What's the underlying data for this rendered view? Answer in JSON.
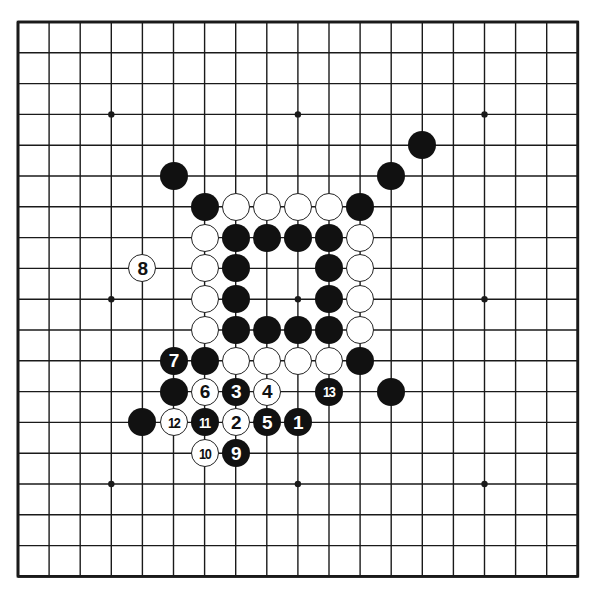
{
  "board": {
    "size": 19,
    "origin_x": 18,
    "origin_y": 22,
    "spacing_x": 31.1,
    "spacing_y": 30.8,
    "line_color": "#1a1a1a",
    "background": "#ffffff",
    "star_points": [
      [
        3,
        3
      ],
      [
        9,
        3
      ],
      [
        15,
        3
      ],
      [
        3,
        9
      ],
      [
        9,
        9
      ],
      [
        15,
        9
      ],
      [
        3,
        15
      ],
      [
        9,
        15
      ],
      [
        15,
        15
      ]
    ]
  },
  "stones": [
    {
      "color": "black",
      "col": 13,
      "row": 4,
      "label": ""
    },
    {
      "color": "black",
      "col": 5,
      "row": 5,
      "label": ""
    },
    {
      "color": "black",
      "col": 12,
      "row": 5,
      "label": ""
    },
    {
      "color": "black",
      "col": 6,
      "row": 6,
      "label": ""
    },
    {
      "color": "white",
      "col": 7,
      "row": 6,
      "label": ""
    },
    {
      "color": "white",
      "col": 8,
      "row": 6,
      "label": ""
    },
    {
      "color": "white",
      "col": 9,
      "row": 6,
      "label": ""
    },
    {
      "color": "white",
      "col": 10,
      "row": 6,
      "label": ""
    },
    {
      "color": "black",
      "col": 11,
      "row": 6,
      "label": ""
    },
    {
      "color": "white",
      "col": 6,
      "row": 7,
      "label": ""
    },
    {
      "color": "black",
      "col": 7,
      "row": 7,
      "label": ""
    },
    {
      "color": "black",
      "col": 8,
      "row": 7,
      "label": ""
    },
    {
      "color": "black",
      "col": 9,
      "row": 7,
      "label": ""
    },
    {
      "color": "black",
      "col": 10,
      "row": 7,
      "label": ""
    },
    {
      "color": "white",
      "col": 11,
      "row": 7,
      "label": ""
    },
    {
      "color": "white",
      "col": 4,
      "row": 8,
      "label": "8"
    },
    {
      "color": "white",
      "col": 6,
      "row": 8,
      "label": ""
    },
    {
      "color": "black",
      "col": 7,
      "row": 8,
      "label": ""
    },
    {
      "color": "black",
      "col": 10,
      "row": 8,
      "label": ""
    },
    {
      "color": "white",
      "col": 11,
      "row": 8,
      "label": ""
    },
    {
      "color": "white",
      "col": 6,
      "row": 9,
      "label": ""
    },
    {
      "color": "black",
      "col": 7,
      "row": 9,
      "label": ""
    },
    {
      "color": "black",
      "col": 10,
      "row": 9,
      "label": ""
    },
    {
      "color": "white",
      "col": 11,
      "row": 9,
      "label": ""
    },
    {
      "color": "white",
      "col": 6,
      "row": 10,
      "label": ""
    },
    {
      "color": "black",
      "col": 7,
      "row": 10,
      "label": ""
    },
    {
      "color": "black",
      "col": 8,
      "row": 10,
      "label": ""
    },
    {
      "color": "black",
      "col": 9,
      "row": 10,
      "label": ""
    },
    {
      "color": "black",
      "col": 10,
      "row": 10,
      "label": ""
    },
    {
      "color": "white",
      "col": 11,
      "row": 10,
      "label": ""
    },
    {
      "color": "black",
      "col": 5,
      "row": 11,
      "label": "7"
    },
    {
      "color": "black",
      "col": 6,
      "row": 11,
      "label": ""
    },
    {
      "color": "white",
      "col": 7,
      "row": 11,
      "label": ""
    },
    {
      "color": "white",
      "col": 8,
      "row": 11,
      "label": ""
    },
    {
      "color": "white",
      "col": 9,
      "row": 11,
      "label": ""
    },
    {
      "color": "white",
      "col": 10,
      "row": 11,
      "label": ""
    },
    {
      "color": "black",
      "col": 11,
      "row": 11,
      "label": ""
    },
    {
      "color": "black",
      "col": 5,
      "row": 12,
      "label": ""
    },
    {
      "color": "white",
      "col": 6,
      "row": 12,
      "label": "6"
    },
    {
      "color": "black",
      "col": 7,
      "row": 12,
      "label": "3"
    },
    {
      "color": "white",
      "col": 8,
      "row": 12,
      "label": "4"
    },
    {
      "color": "black",
      "col": 10,
      "row": 12,
      "label": "13"
    },
    {
      "color": "black",
      "col": 12,
      "row": 12,
      "label": ""
    },
    {
      "color": "black",
      "col": 4,
      "row": 13,
      "label": ""
    },
    {
      "color": "white",
      "col": 5,
      "row": 13,
      "label": "12"
    },
    {
      "color": "black",
      "col": 6,
      "row": 13,
      "label": "11"
    },
    {
      "color": "white",
      "col": 7,
      "row": 13,
      "label": "2"
    },
    {
      "color": "black",
      "col": 8,
      "row": 13,
      "label": "5"
    },
    {
      "color": "black",
      "col": 9,
      "row": 13,
      "label": "1"
    },
    {
      "color": "white",
      "col": 6,
      "row": 14,
      "label": "10"
    },
    {
      "color": "black",
      "col": 7,
      "row": 14,
      "label": "9"
    }
  ]
}
